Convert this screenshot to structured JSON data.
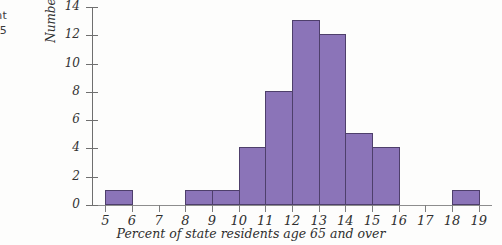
{
  "caption_fragment": {
    "line1": "cent",
    "line2": "e 65"
  },
  "chart_data": {
    "type": "bar",
    "title": "",
    "xlabel": "Percent of state residents age 65 and over",
    "ylabel": "Number of states",
    "categories": [
      "5-6",
      "6-7",
      "7-8",
      "8-9",
      "9-10",
      "10-11",
      "11-12",
      "12-13",
      "13-14",
      "14-15",
      "15-16",
      "16-17",
      "17-18",
      "18-19"
    ],
    "bin_starts": [
      5,
      6,
      7,
      8,
      9,
      10,
      11,
      12,
      13,
      14,
      15,
      16,
      17,
      18
    ],
    "bin_width": 1,
    "values": [
      1,
      0,
      0,
      1,
      1,
      4,
      8,
      13,
      12,
      5,
      4,
      0,
      0,
      1
    ],
    "total": 50,
    "xlim": [
      4.5,
      19.5
    ],
    "ylim": [
      0,
      14
    ],
    "xticks": [
      5,
      6,
      7,
      8,
      9,
      10,
      11,
      12,
      13,
      14,
      15,
      16,
      17,
      18,
      19
    ],
    "yticks": [
      0,
      2,
      4,
      6,
      8,
      10,
      12,
      14
    ],
    "xticklabels": [
      "5",
      "6",
      "7",
      "8",
      "9",
      "10",
      "11",
      "12",
      "13",
      "14",
      "15",
      "16",
      "17",
      "18",
      "19"
    ],
    "yticklabels": [
      "0",
      "2",
      "4",
      "6",
      "8",
      "10",
      "12",
      "14"
    ],
    "grid": false,
    "legend": null,
    "bar_color": "#8b74b8",
    "bar_edge_color": "#4e3f6b",
    "axis_color": "#7d7d7d",
    "background_color": "#fdfdfc"
  }
}
